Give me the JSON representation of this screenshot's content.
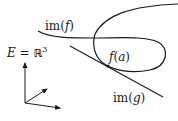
{
  "diagram": {
    "space_label": {
      "E": "E",
      "eq": "=",
      "R": "ℝ",
      "exp": "3"
    },
    "labels": {
      "im_f": {
        "pre": "im(",
        "var": "f",
        "post": ")"
      },
      "im_g": {
        "pre": "im(",
        "var": "g",
        "post": ")"
      },
      "f_a": {
        "fn": "f",
        "open": "(",
        "var": "a",
        "close": ")"
      }
    },
    "colors": {
      "stroke": "#1a1a1a",
      "background": "#ffffff"
    },
    "elements": [
      {
        "id": "curve-im-f",
        "kind": "loop curve",
        "label": "im(f)"
      },
      {
        "id": "curve-upper-branch",
        "kind": "curve"
      },
      {
        "id": "line-im-g",
        "kind": "tangent line",
        "label": "im(g)"
      },
      {
        "id": "point-f-a",
        "kind": "point",
        "label": "f(a)"
      },
      {
        "id": "axes",
        "kind": "3d coordinate axes",
        "count": 3
      }
    ]
  }
}
